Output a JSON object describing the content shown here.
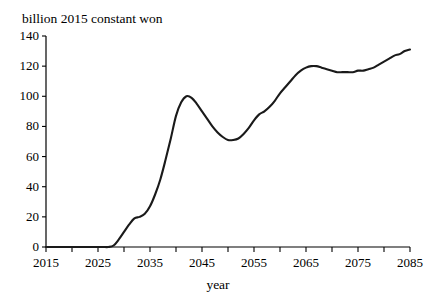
{
  "chart_data": {
    "type": "line",
    "title": "",
    "xlabel": "year",
    "ylabel": "billion 2015 constant won",
    "ylabel_position": "top-left",
    "xlim": [
      2015,
      2085
    ],
    "ylim": [
      0,
      140
    ],
    "grid": false,
    "legend": null,
    "x_tick_labels": [
      "2015",
      "2025",
      "2035",
      "2045",
      "2055",
      "2065",
      "2075",
      "2085"
    ],
    "x_tick_values": [
      2015,
      2025,
      2035,
      2045,
      2055,
      2065,
      2075,
      2085
    ],
    "x_minor_tick_values": [
      2020,
      2030,
      2040,
      2050,
      2060,
      2070,
      2080
    ],
    "y_tick_labels": [
      "0",
      "20",
      "40",
      "60",
      "80",
      "100",
      "120",
      "140"
    ],
    "y_tick_values": [
      0,
      20,
      40,
      60,
      80,
      100,
      120,
      140
    ],
    "line_color": "#1a1a1a",
    "line_width": 2.1,
    "series": [
      {
        "name": "value",
        "x": [
          2015,
          2016,
          2017,
          2018,
          2019,
          2020,
          2021,
          2022,
          2023,
          2024,
          2025,
          2026,
          2027,
          2028,
          2029,
          2030,
          2031,
          2032,
          2033,
          2034,
          2035,
          2036,
          2037,
          2038,
          2039,
          2040,
          2041,
          2042,
          2043,
          2044,
          2045,
          2046,
          2047,
          2048,
          2049,
          2050,
          2051,
          2052,
          2053,
          2054,
          2055,
          2056,
          2057,
          2058,
          2059,
          2060,
          2061,
          2062,
          2063,
          2064,
          2065,
          2066,
          2067,
          2068,
          2069,
          2070,
          2071,
          2072,
          2073,
          2074,
          2075,
          2076,
          2077,
          2078,
          2079,
          2080,
          2081,
          2082,
          2083,
          2084,
          2085
        ],
        "y": [
          0,
          0,
          0,
          0,
          0,
          0,
          0,
          0,
          0,
          0,
          0,
          0,
          0,
          1,
          5,
          10,
          15,
          19,
          20,
          22,
          27,
          35,
          45,
          58,
          72,
          87,
          96,
          100,
          99,
          95,
          90,
          85,
          80,
          76,
          73,
          71,
          71,
          72,
          75,
          79,
          84,
          88,
          90,
          93,
          97,
          102,
          106,
          110,
          114,
          117,
          119,
          120,
          120,
          119,
          118,
          117,
          116,
          116,
          116,
          116,
          117,
          117,
          118,
          119,
          121,
          123,
          125,
          127,
          128,
          130,
          131
        ]
      }
    ]
  },
  "layout": {
    "plot_left_px": 46,
    "plot_right_px": 410,
    "plot_bottom_px": 247,
    "plot_top_px": 36
  }
}
